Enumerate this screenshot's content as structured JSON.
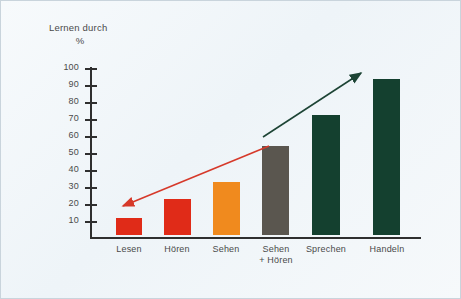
{
  "title": {
    "line1": "Lernen durch",
    "line2": "%"
  },
  "chart_data": {
    "type": "bar",
    "title": "Lernen durch",
    "xlabel": "",
    "ylabel": "%",
    "ylim": [
      0,
      100
    ],
    "grid": false,
    "legend": "none",
    "yticks": [
      100,
      90,
      80,
      70,
      60,
      50,
      40,
      30,
      20,
      10
    ],
    "categories": [
      "Lesen",
      "Hören",
      "Sehen",
      "Sehen\n+ Hören",
      "Sprechen",
      "Handeln"
    ],
    "values": [
      10,
      21,
      31,
      52,
      70,
      91
    ],
    "bar_colors": [
      "#e02b18",
      "#e02b18",
      "#f08a1e",
      "#5a564f",
      "#14402f",
      "#14402f"
    ],
    "annotations": [
      {
        "name": "declining-red-arrow",
        "type": "arrow",
        "color": "#d6392a",
        "direction": "down-left",
        "from": [
          268,
          145
        ],
        "to": [
          122,
          205
        ]
      },
      {
        "name": "rising-green-arrow",
        "type": "arrow",
        "color": "#1d4435",
        "direction": "up-right",
        "from": [
          262,
          136
        ],
        "to": [
          360,
          72
        ]
      }
    ]
  },
  "axis": {
    "ticks": [
      {
        "value": "100",
        "y": 67
      },
      {
        "value": "90",
        "y": 84
      },
      {
        "value": "80",
        "y": 101
      },
      {
        "value": "70",
        "y": 118
      },
      {
        "value": "60",
        "y": 135
      },
      {
        "value": "50",
        "y": 152
      },
      {
        "value": "40",
        "y": 169
      },
      {
        "value": "30",
        "y": 186
      },
      {
        "value": "20",
        "y": 203
      },
      {
        "value": "10",
        "y": 220
      }
    ]
  },
  "bars": [
    {
      "label": "Lesen",
      "label2": "",
      "value": 10,
      "color": "#e02b18",
      "left": 115,
      "width": 26,
      "height": 17,
      "label_left": 105,
      "label_width": 46
    },
    {
      "label": "Hören",
      "label2": "",
      "value": 21,
      "color": "#e02b18",
      "left": 163,
      "width": 27,
      "height": 36,
      "label_left": 153,
      "label_width": 46
    },
    {
      "label": "Sehen",
      "label2": "",
      "value": 31,
      "color": "#f08a1e",
      "left": 212,
      "width": 27,
      "height": 53,
      "label_left": 202,
      "label_width": 46
    },
    {
      "label": "Sehen",
      "label2": "+ Hören",
      "value": 52,
      "color": "#5a564f",
      "left": 261,
      "width": 27,
      "height": 89,
      "label_left": 247,
      "label_width": 56
    },
    {
      "label": "Sprechen",
      "label2": "",
      "value": 70,
      "color": "#14402f",
      "left": 311,
      "width": 28,
      "height": 120,
      "label_left": 297,
      "label_width": 56
    },
    {
      "label": "Handeln",
      "label2": "",
      "value": 91,
      "color": "#14402f",
      "left": 372,
      "width": 27,
      "height": 156,
      "label_left": 359,
      "label_width": 54
    }
  ]
}
